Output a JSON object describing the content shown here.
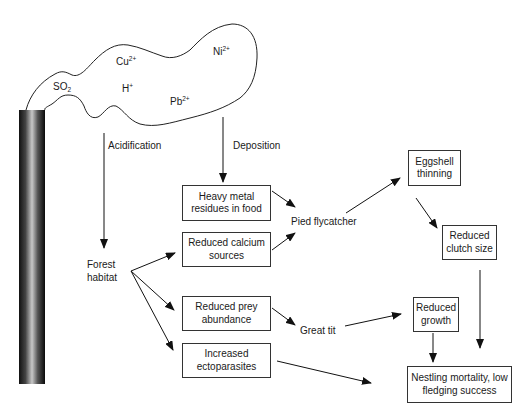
{
  "diagram": {
    "emission_source": "smokestack",
    "cloud_ions": [
      {
        "id": "cu",
        "base": "Cu",
        "sup": "2+",
        "sub": ""
      },
      {
        "id": "ni",
        "base": "Ni",
        "sup": "2+",
        "sub": ""
      },
      {
        "id": "so2",
        "base": "SO",
        "sup": "",
        "sub": "2"
      },
      {
        "id": "h",
        "base": "H",
        "sup": "+",
        "sub": ""
      },
      {
        "id": "pb",
        "base": "Pb",
        "sup": "2+",
        "sub": ""
      }
    ],
    "pathways": {
      "acidification": "Acidification",
      "deposition": "Deposition"
    },
    "nodes": {
      "forest_habitat": "Forest\nhabitat",
      "heavy_metal": "Heavy metal\nresidues in food",
      "reduced_calcium": "Reduced calcium\nsources",
      "reduced_prey": "Reduced prey\nabundance",
      "ectoparasites": "Increased\nectoparasites",
      "pied_flycatcher": "Pied flycatcher",
      "great_tit": "Great tit",
      "eggshell": "Eggshell\nthinning",
      "clutch": "Reduced\nclutch size",
      "growth": "Reduced\ngrowth",
      "nestling": "Nestling mortality, low\nfledging success"
    },
    "edges": [
      [
        "smokestack",
        "forest_habitat",
        "Acidification"
      ],
      [
        "cloud",
        "heavy_metal",
        "Deposition"
      ],
      [
        "forest_habitat",
        "reduced_calcium"
      ],
      [
        "forest_habitat",
        "reduced_prey"
      ],
      [
        "forest_habitat",
        "ectoparasites"
      ],
      [
        "heavy_metal",
        "pied_flycatcher"
      ],
      [
        "reduced_calcium",
        "pied_flycatcher"
      ],
      [
        "pied_flycatcher",
        "eggshell"
      ],
      [
        "eggshell",
        "clutch"
      ],
      [
        "clutch",
        "nestling"
      ],
      [
        "reduced_prey",
        "great_tit"
      ],
      [
        "great_tit",
        "growth"
      ],
      [
        "growth",
        "nestling"
      ],
      [
        "ectoparasites",
        "nestling"
      ]
    ]
  }
}
